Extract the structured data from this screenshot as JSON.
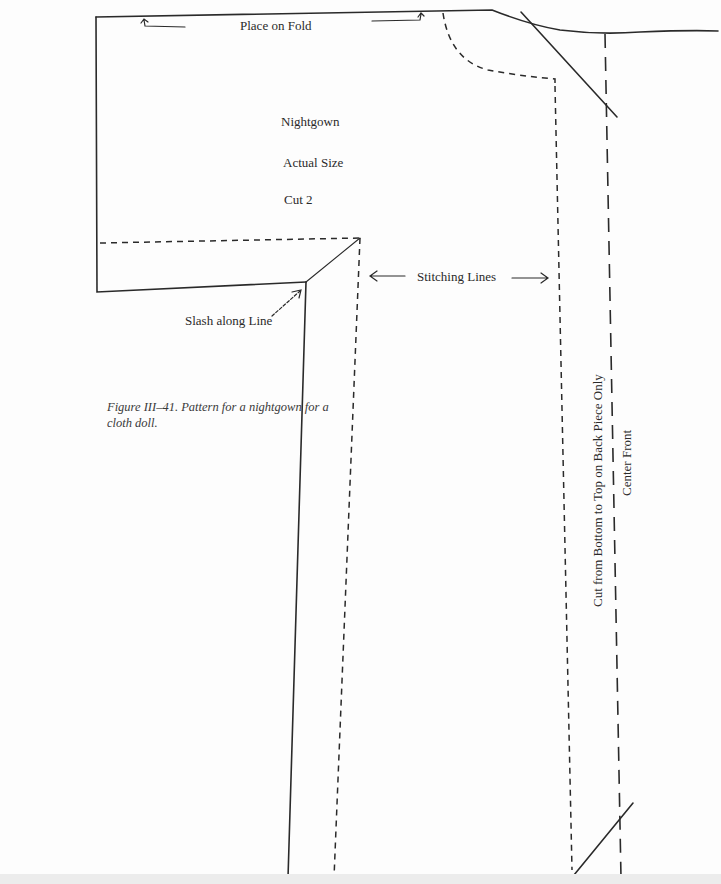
{
  "figure": {
    "caption": "Figure III–41. Pattern for a nightgown for a cloth doll.",
    "labels": {
      "place_on_fold": "Place on Fold",
      "title": "Nightgown",
      "actual_size": "Actual Size",
      "cut_count": "Cut 2",
      "stitching_lines": "Stitching Lines",
      "slash_along_line": "Slash along Line",
      "cut_back_piece": "Cut from Bottom to Top on Back Piece Only",
      "center_front": "Center Front"
    },
    "colors": {
      "line": "#2a2a2a",
      "background": "#fdfdfd"
    }
  }
}
